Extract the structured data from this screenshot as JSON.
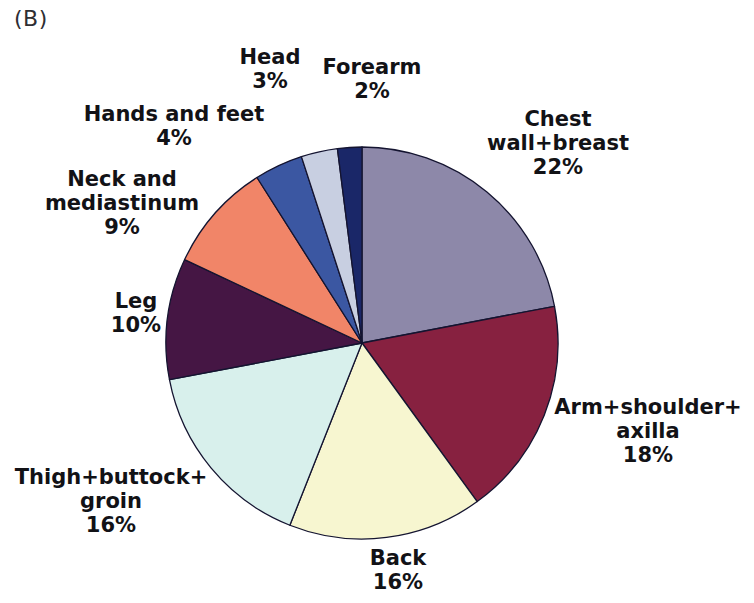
{
  "figure": {
    "panel_label": "(B)",
    "background_color": "#ffffff",
    "text_color": "#121216"
  },
  "chart_data": {
    "type": "pie",
    "title": "",
    "legend": "none",
    "units": "%",
    "total": 100,
    "start_angle_deg": 0,
    "direction": "clockwise",
    "center": {
      "x": 362,
      "y": 343
    },
    "radius": 196,
    "stroke_color": "#141430",
    "stroke_width": 1.3,
    "slices": [
      {
        "label": "Chest wall+breast",
        "pct": 22,
        "color": "#8d88a9",
        "label_lines": [
          "Chest",
          "wall+breast",
          "22%"
        ],
        "label_x": 558,
        "label_y": 143
      },
      {
        "label": "Arm+shoulder+axilla",
        "pct": 18,
        "color": "#872140",
        "label_lines": [
          "Arm+shoulder+",
          "axilla",
          "18%"
        ],
        "label_x": 648,
        "label_y": 431
      },
      {
        "label": "Back",
        "pct": 16,
        "color": "#f7f6d0",
        "label_lines": [
          "Back",
          "16%"
        ],
        "label_x": 398,
        "label_y": 570
      },
      {
        "label": "Thigh+buttock+groin",
        "pct": 16,
        "color": "#d8f0ec",
        "label_lines": [
          "Thigh+buttock+",
          "groin",
          "16%"
        ],
        "label_x": 111,
        "label_y": 501
      },
      {
        "label": "Leg",
        "pct": 10,
        "color": "#451644",
        "label_lines": [
          "Leg",
          "10%"
        ],
        "label_x": 136,
        "label_y": 313
      },
      {
        "label": "Neck and mediastinum",
        "pct": 9,
        "color": "#f18568",
        "label_lines": [
          "Neck and",
          "mediastinum",
          "9%"
        ],
        "label_x": 122,
        "label_y": 203
      },
      {
        "label": "Hands and feet",
        "pct": 4,
        "color": "#3b57a2",
        "label_lines": [
          "Hands and feet",
          "4%"
        ],
        "label_x": 174,
        "label_y": 126
      },
      {
        "label": "Head",
        "pct": 3,
        "color": "#c8cfe1",
        "label_lines": [
          "Head",
          "3%"
        ],
        "label_x": 270,
        "label_y": 69
      },
      {
        "label": "Forearm",
        "pct": 2,
        "color": "#1a2768",
        "label_lines": [
          "Forearm",
          "2%"
        ],
        "label_x": 372,
        "label_y": 79
      }
    ]
  }
}
